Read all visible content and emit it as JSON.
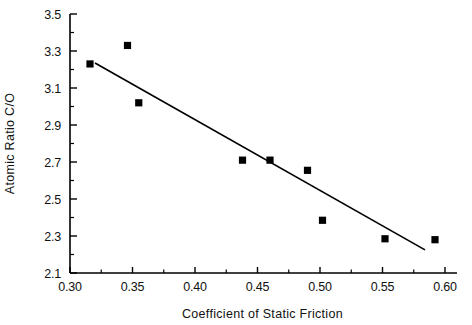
{
  "chart_data": {
    "type": "scatter",
    "title": "",
    "xlabel": "Coefficient of Static Friction",
    "ylabel": "Atomic Ratio C/O",
    "xlim": [
      0.3,
      0.6
    ],
    "ylim": [
      2.1,
      3.5
    ],
    "xticks": [
      "0.30",
      "0.35",
      "0.40",
      "0.45",
      "0.50",
      "0.55",
      "0.60"
    ],
    "xtick_values": [
      0.3,
      0.35,
      0.4,
      0.45,
      0.5,
      0.55,
      0.6
    ],
    "xminor_values": [
      0.325,
      0.375,
      0.425,
      0.475,
      0.525,
      0.575
    ],
    "yticks": [
      "3.5",
      "3.3",
      "3.1",
      "2.9",
      "2.7",
      "2.5",
      "2.3",
      "2.1"
    ],
    "ytick_values": [
      3.5,
      3.3,
      3.1,
      2.9,
      2.7,
      2.5,
      2.3,
      2.1
    ],
    "yminor_values": [
      3.4,
      3.2,
      3.0,
      2.8,
      2.6,
      2.4,
      2.2
    ],
    "grid": false,
    "legend": null,
    "marker": "filled-square",
    "marker_color": "#000000",
    "line_color": "#000000",
    "points": [
      {
        "x": 0.316,
        "y": 3.23
      },
      {
        "x": 0.346,
        "y": 3.33
      },
      {
        "x": 0.355,
        "y": 3.02
      },
      {
        "x": 0.438,
        "y": 2.71
      },
      {
        "x": 0.46,
        "y": 2.71
      },
      {
        "x": 0.49,
        "y": 2.655
      },
      {
        "x": 0.502,
        "y": 2.385
      },
      {
        "x": 0.552,
        "y": 2.285
      },
      {
        "x": 0.592,
        "y": 2.28
      }
    ],
    "trendline": {
      "type": "linear-fit",
      "x_start": 0.32,
      "y_start": 3.235,
      "x_end": 0.584,
      "y_end": 2.225
    }
  }
}
